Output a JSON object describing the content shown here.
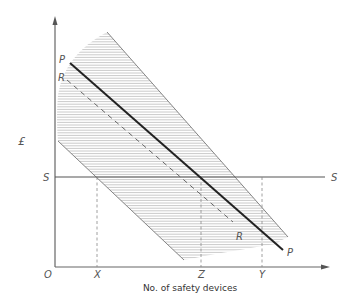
{
  "diagram": {
    "y_axis_label": "£",
    "x_axis_label": "No. of safety devices",
    "origin_label": "O",
    "x_ticks": [
      "X",
      "Z",
      "Y"
    ],
    "line_labels": {
      "P_start": "P",
      "P_end": "P",
      "R_start": "R",
      "R_end": "R",
      "S_left": "S",
      "S_right": "S"
    },
    "elements": [
      {
        "id": "P",
        "style": "solid-thick",
        "description": "line P"
      },
      {
        "id": "R",
        "style": "dashed",
        "description": "line R"
      },
      {
        "id": "S",
        "style": "solid-horizontal",
        "description": "level S"
      },
      {
        "id": "band",
        "style": "hatched",
        "description": "shaded band around P"
      }
    ]
  }
}
